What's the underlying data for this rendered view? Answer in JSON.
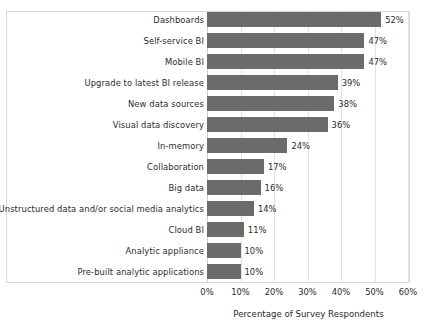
{
  "chart_data": {
    "type": "bar",
    "orientation": "horizontal",
    "title": "",
    "xlabel": "Percentage of Survey Respondents",
    "ylabel": "",
    "xlim": [
      0,
      60
    ],
    "xticks": [
      "0%",
      "10%",
      "20%",
      "30%",
      "40%",
      "50%",
      "60%"
    ],
    "xtick_values": [
      0,
      10,
      20,
      30,
      40,
      50,
      60
    ],
    "grid": true,
    "legend": null,
    "bar_color": "#6b6b6b",
    "categories": [
      "Dashboards",
      "Self-service BI",
      "Mobile BI",
      "Upgrade to latest BI release",
      "New data sources",
      "Visual data discovery",
      "In-memory",
      "Collaboration",
      "Big data",
      "Unstructured data and/or social media analytics",
      "Cloud BI",
      "Analytic appliance",
      "Pre-built analytic applications"
    ],
    "values": [
      52,
      47,
      47,
      39,
      38,
      36,
      24,
      17,
      16,
      14,
      11,
      10,
      10
    ],
    "data_labels": [
      "52%",
      "47%",
      "47%",
      "39%",
      "38%",
      "36%",
      "24%",
      "17%",
      "16%",
      "14%",
      "11%",
      "10%",
      "10%"
    ]
  }
}
